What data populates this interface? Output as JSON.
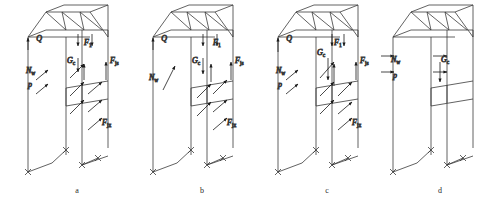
{
  "figure": {
    "title": "",
    "panel_count": 4
  },
  "panels": [
    {
      "id": "a",
      "caption": "a",
      "caption_x": 77,
      "origin_x": 22,
      "labels": [
        {
          "name": "Q",
          "base": "Q",
          "sub": "",
          "x": 20,
          "y": 41,
          "anchor": "end"
        },
        {
          "name": "N_w",
          "base": "N",
          "sub": "w",
          "x": 4,
          "y": 73,
          "anchor": "start"
        },
        {
          "name": "p",
          "base": "p",
          "sub": "",
          "x": 6,
          "y": 87,
          "anchor": "start"
        },
        {
          "name": "G_c",
          "base": "G",
          "sub": "c",
          "x": 45,
          "y": 63,
          "anchor": "start"
        },
        {
          "name": "F_1",
          "base": "F",
          "sub": "1",
          "x": 62,
          "y": 45,
          "anchor": "start"
        },
        {
          "name": "F_js",
          "base": "F",
          "sub": "js",
          "x": 88,
          "y": 63,
          "anchor": "start"
        },
        {
          "name": "F_jx",
          "base": "F",
          "sub": "jx",
          "x": 80,
          "y": 125,
          "anchor": "start"
        }
      ]
    },
    {
      "id": "b",
      "caption": "b",
      "caption_x": 202,
      "origin_x": 147,
      "labels": [
        {
          "name": "Q",
          "base": "Q",
          "sub": "",
          "x": 20,
          "y": 41,
          "anchor": "end"
        },
        {
          "name": "N_w",
          "base": "N",
          "sub": "w",
          "x": 2,
          "y": 80,
          "anchor": "start"
        },
        {
          "name": "G_c",
          "base": "G",
          "sub": "c",
          "x": 45,
          "y": 63,
          "anchor": "start"
        },
        {
          "name": "F_1",
          "base": "F",
          "sub": "1",
          "x": 66,
          "y": 45,
          "anchor": "start"
        },
        {
          "name": "F_js",
          "base": "F",
          "sub": "js",
          "x": 88,
          "y": 63,
          "anchor": "start"
        },
        {
          "name": "F_jx",
          "base": "F",
          "sub": "jx",
          "x": 80,
          "y": 125,
          "anchor": "start"
        }
      ]
    },
    {
      "id": "c",
      "caption": "c",
      "caption_x": 327,
      "origin_x": 272,
      "labels": [
        {
          "name": "Q",
          "base": "Q",
          "sub": "",
          "x": 20,
          "y": 41,
          "anchor": "end"
        },
        {
          "name": "N_w",
          "base": "N",
          "sub": "w",
          "x": 4,
          "y": 73,
          "anchor": "start"
        },
        {
          "name": "p",
          "base": "p",
          "sub": "",
          "x": 6,
          "y": 87,
          "anchor": "start"
        },
        {
          "name": "G_c",
          "base": "G",
          "sub": "c",
          "x": 45,
          "y": 55,
          "anchor": "start"
        },
        {
          "name": "F_1",
          "base": "F",
          "sub": "1",
          "x": 62,
          "y": 45,
          "anchor": "start"
        },
        {
          "name": "F_js",
          "base": "F",
          "sub": "js",
          "x": 88,
          "y": 63,
          "anchor": "start"
        },
        {
          "name": "F_jx",
          "base": "F",
          "sub": "jx",
          "x": 80,
          "y": 125,
          "anchor": "start"
        }
      ]
    },
    {
      "id": "d",
      "caption": "d",
      "caption_x": 440,
      "origin_x": 387,
      "labels": [
        {
          "name": "N_w",
          "base": "N",
          "sub": "w",
          "x": 4,
          "y": 62,
          "anchor": "start"
        },
        {
          "name": "p",
          "base": "p",
          "sub": "",
          "x": 6,
          "y": 78,
          "anchor": "start"
        },
        {
          "name": "G_c",
          "base": "G",
          "sub": "c",
          "x": 54,
          "y": 62,
          "anchor": "start"
        }
      ]
    }
  ],
  "style": {
    "line_color": "#3a3a3a",
    "arrow_color": "#1a1a1a",
    "background": "#ffffff"
  }
}
